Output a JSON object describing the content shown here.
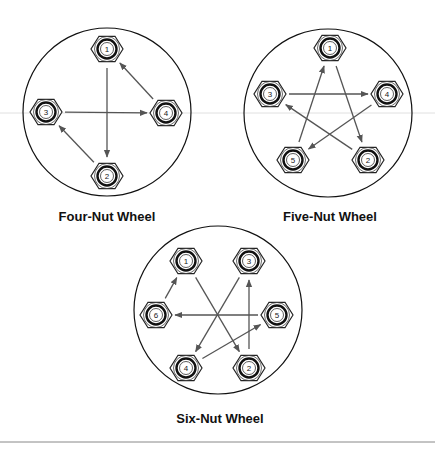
{
  "colors": {
    "outline": "#111111",
    "arrow": "#555555",
    "guide_line": "#d9d9d9",
    "rule": "#888888"
  },
  "wheels": [
    {
      "title": "Four-Nut Wheel",
      "center": [
        107,
        112
      ],
      "radius": 84,
      "label_pos": [
        107,
        209
      ],
      "nuts": [
        {
          "n": "1",
          "x": 107,
          "y": 49
        },
        {
          "n": "2",
          "x": 107,
          "y": 176
        },
        {
          "n": "3",
          "x": 46,
          "y": 112
        },
        {
          "n": "4",
          "x": 166,
          "y": 113
        }
      ],
      "sequence": [
        "1",
        "2",
        "3",
        "4",
        "1"
      ]
    },
    {
      "title": "Five-Nut Wheel",
      "center": [
        328,
        113
      ],
      "radius": 84,
      "label_pos": [
        330,
        209
      ],
      "nuts": [
        {
          "n": "1",
          "x": 330,
          "y": 48
        },
        {
          "n": "2",
          "x": 368,
          "y": 160
        },
        {
          "n": "3",
          "x": 270,
          "y": 94
        },
        {
          "n": "4",
          "x": 387,
          "y": 94
        },
        {
          "n": "5",
          "x": 293,
          "y": 160
        }
      ],
      "sequence": [
        "1",
        "2",
        "3",
        "4",
        "5",
        "1"
      ]
    },
    {
      "title": "Six-Nut Wheel",
      "center": [
        218,
        310
      ],
      "radius": 84,
      "label_pos": [
        220,
        411
      ],
      "nuts": [
        {
          "n": "1",
          "x": 186,
          "y": 261
        },
        {
          "n": "2",
          "x": 249,
          "y": 368
        },
        {
          "n": "3",
          "x": 249,
          "y": 261
        },
        {
          "n": "4",
          "x": 186,
          "y": 368
        },
        {
          "n": "5",
          "x": 277,
          "y": 315
        },
        {
          "n": "6",
          "x": 156,
          "y": 315
        }
      ],
      "sequence": [
        "1",
        "2",
        "3",
        "4",
        "5",
        "6",
        "1"
      ]
    }
  ]
}
